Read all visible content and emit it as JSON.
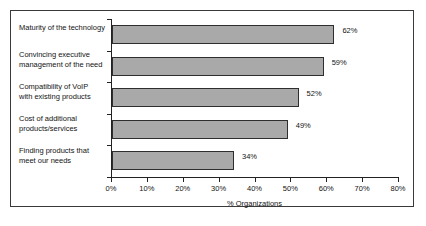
{
  "chart_data": {
    "type": "bar",
    "orientation": "horizontal",
    "title": "",
    "xlabel": "% Organizations",
    "ylabel": "",
    "xlim": [
      0,
      80
    ],
    "grid": false,
    "legend": null,
    "categories": [
      "Maturity of the technology",
      "Convincing executive management of the need",
      "Compatibility of VoIP with existing products",
      "Cost of additional products/services",
      "Finding products that meet our needs"
    ],
    "values": [
      62,
      59,
      52,
      49,
      34
    ],
    "value_labels": [
      "62%",
      "59%",
      "52%",
      "49%",
      "34%"
    ],
    "xticks": [
      0,
      10,
      20,
      30,
      40,
      50,
      60,
      70,
      80
    ],
    "xtick_labels": [
      "0%",
      "10%",
      "20%",
      "30%",
      "40%",
      "50%",
      "60%",
      "70%",
      "80%"
    ],
    "bar_color": "#a9a9a9",
    "bar_border_color": "#2e2e2e",
    "axis_color": "#222222"
  },
  "category_label_lines": [
    [
      "Maturity of the technology"
    ],
    [
      "Convincing executive",
      "management of the need"
    ],
    [
      "Compatibility of VoIP",
      "with existing products"
    ],
    [
      "Cost of additional",
      "products/services"
    ],
    [
      "Finding products that",
      "meet our needs"
    ]
  ],
  "caption": {
    "text": ""
  }
}
